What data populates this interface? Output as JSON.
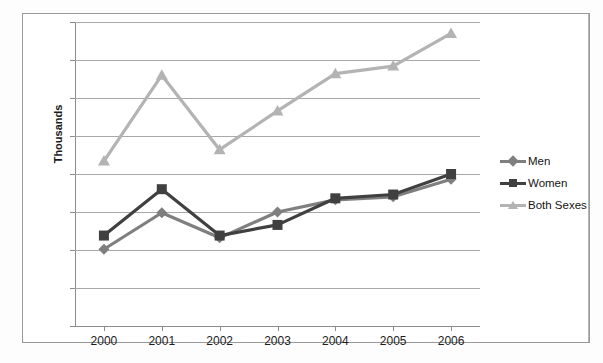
{
  "chart_data": {
    "type": "line",
    "title": "",
    "xlabel": "",
    "ylabel": "Thousands",
    "categories": [
      "2000",
      "2001",
      "2002",
      "2003",
      "2004",
      "2005",
      "2006"
    ],
    "ylim": [
      0,
      40
    ],
    "yticks": [
      0,
      5,
      10,
      15,
      20,
      25,
      30,
      35,
      40
    ],
    "grid": true,
    "legend_position": "right",
    "series": [
      {
        "name": "Men",
        "color": "#7f7f7f",
        "marker": "diamond",
        "values": [
          10.1,
          14.9,
          11.6,
          15.0,
          16.6,
          17.0,
          19.3
        ]
      },
      {
        "name": "Women",
        "color": "#404040",
        "marker": "square",
        "values": [
          11.9,
          18.0,
          11.9,
          13.3,
          16.8,
          17.3,
          20.0
        ]
      },
      {
        "name": "Both Sexes",
        "color": "#b3b3b3",
        "marker": "triangle",
        "values": [
          21.7,
          33.0,
          23.2,
          28.3,
          33.2,
          34.2,
          38.5
        ]
      }
    ]
  },
  "axis": {
    "y_title": "Thousands",
    "y_tick_labels": [
      "0",
      "5",
      "10",
      "15",
      "20",
      "25",
      "30",
      "35",
      "40"
    ],
    "x_tick_labels": [
      "2000",
      "2001",
      "2002",
      "2003",
      "2004",
      "2005",
      "2006"
    ]
  },
  "legend": {
    "entries": [
      {
        "label": "Men",
        "color": "#7f7f7f",
        "marker": "diamond"
      },
      {
        "label": "Women",
        "color": "#404040",
        "marker": "square"
      },
      {
        "label": "Both Sexes",
        "color": "#b3b3b3",
        "marker": "triangle"
      }
    ]
  },
  "colors": {
    "gridline": "#a8a8a8",
    "axis": "#8c8c8c",
    "frame_border": "#9a9a9a",
    "text": "#1c1c1c",
    "background": "#ffffff"
  }
}
